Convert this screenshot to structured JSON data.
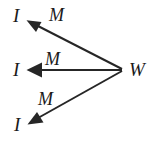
{
  "diagram": {
    "type": "directed-graph",
    "background_color": "#ffffff",
    "stroke_color": "#262626",
    "stroke_width": 2,
    "source_node": {
      "id": "W",
      "label": "W",
      "x": 123,
      "y": 70
    },
    "target_nodes": [
      {
        "id": "I-top",
        "label": "I",
        "x": 24,
        "y": 16
      },
      {
        "id": "I-middle",
        "label": "I",
        "x": 24,
        "y": 70
      },
      {
        "id": "I-bottom",
        "label": "I",
        "x": 26,
        "y": 124
      }
    ],
    "edges": [
      {
        "id": "edge-top",
        "from": "W",
        "to": "I-top",
        "label": "M",
        "arrowhead": "filled-triangle",
        "direction": "up-left"
      },
      {
        "id": "edge-middle",
        "from": "W",
        "to": "I-middle",
        "label": "M",
        "arrowhead": "filled-triangle",
        "direction": "left"
      },
      {
        "id": "edge-bottom",
        "from": "W",
        "to": "I-bottom",
        "label": "M",
        "arrowhead": "filled-triangle",
        "direction": "down-left"
      }
    ]
  }
}
